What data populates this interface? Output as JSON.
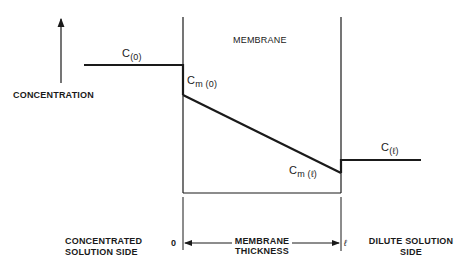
{
  "diagram": {
    "labels": {
      "membrane": "MEMBRANE",
      "concentration_axis": "CONCENTRATION",
      "c0_base": "C",
      "c0_sub": "(0)",
      "cm0_base": "C",
      "cm0_sub": "m (0)",
      "cml_base": "C",
      "cml_sub": "m (ℓ)",
      "cl_base": "C",
      "cl_sub": "(ℓ)",
      "concentrated_side_line1": "CONCENTRATED",
      "concentrated_side_line2": "SOLUTION SIDE",
      "dilute_side_line1": "DILUTE SOLUTION",
      "dilute_side_line2": "SIDE",
      "thickness_line1": "MEMBRANE",
      "thickness_line2": "THICKNESS",
      "x_start": "0",
      "x_end": "ℓ"
    },
    "colors": {
      "line": "#1a1a1a",
      "background": "#ffffff"
    }
  }
}
